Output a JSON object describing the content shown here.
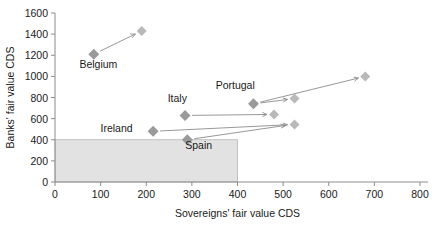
{
  "chart_data": {
    "type": "scatter",
    "title": "",
    "xlabel": "Sovereigns' fair value CDS",
    "ylabel": "Banks' fair value CDS",
    "xlim": [
      0,
      800
    ],
    "ylim": [
      0,
      1600
    ],
    "xticks": [
      "0",
      "100",
      "200",
      "300",
      "400",
      "500",
      "600",
      "700",
      "800"
    ],
    "yticks": [
      "0",
      "200",
      "400",
      "600",
      "800",
      "1000",
      "1200",
      "1400",
      "1600"
    ],
    "grid": false,
    "legend": "none",
    "shaded_region": {
      "label": "shaded-threshold-box",
      "x_range": [
        0,
        400
      ],
      "y_range": [
        0,
        400
      ],
      "color": "#e2e2e2"
    },
    "annotations": [
      {
        "text": "Belgium",
        "x": 95,
        "y": 1075
      },
      {
        "text": "Italy",
        "x": 268,
        "y": 760
      },
      {
        "text": "Ireland",
        "x": 135,
        "y": 470
      },
      {
        "text": "Spain",
        "x": 315,
        "y": 315
      },
      {
        "text": "Portugal",
        "x": 395,
        "y": 880
      }
    ],
    "series": [
      {
        "name": "Belgium",
        "start": {
          "x": 85,
          "y": 1210
        },
        "end": {
          "x": 190,
          "y": 1430
        },
        "arrow": true
      },
      {
        "name": "Portugal",
        "start": {
          "x": 435,
          "y": 740
        },
        "end": {
          "x": 680,
          "y": 1000
        },
        "arrow": true
      },
      {
        "name": "Portugal-short",
        "start": {
          "x": 435,
          "y": 740
        },
        "end": {
          "x": 525,
          "y": 790
        },
        "arrow": true
      },
      {
        "name": "Italy",
        "start": {
          "x": 285,
          "y": 630
        },
        "end": {
          "x": 480,
          "y": 640
        },
        "arrow": true
      },
      {
        "name": "Ireland",
        "start": {
          "x": 215,
          "y": 480
        },
        "end": {
          "x": 525,
          "y": 545
        },
        "arrow": true
      },
      {
        "name": "Spain",
        "start": {
          "x": 290,
          "y": 400
        },
        "end": {
          "x": 520,
          "y": 545
        },
        "arrow": true
      }
    ],
    "start_points": [
      {
        "name": "Belgium",
        "x": 85,
        "y": 1210
      },
      {
        "name": "Portugal",
        "x": 435,
        "y": 740
      },
      {
        "name": "Italy",
        "x": 285,
        "y": 630
      },
      {
        "name": "Ireland",
        "x": 215,
        "y": 480
      },
      {
        "name": "Spain",
        "x": 290,
        "y": 400
      }
    ],
    "end_points": [
      {
        "name": "Belgium",
        "x": 190,
        "y": 1430
      },
      {
        "name": "Portugal",
        "x": 680,
        "y": 1000
      },
      {
        "name": "Portugal-short",
        "x": 525,
        "y": 790
      },
      {
        "name": "Italy",
        "x": 480,
        "y": 640
      },
      {
        "name": "Ireland",
        "x": 525,
        "y": 545
      }
    ],
    "colors": {
      "marker_start": "#9a9a9a",
      "marker_end": "#b9b9b9",
      "axis": "#8c8c8c",
      "arrow": "#8c8c8c",
      "shade": "#e2e2e2",
      "text": "#1a1a1a"
    }
  }
}
